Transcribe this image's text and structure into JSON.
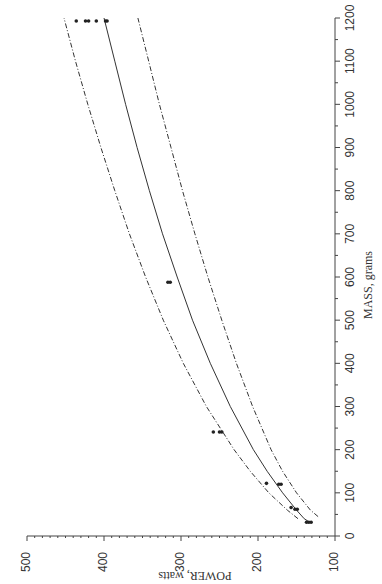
{
  "chart_data": {
    "type": "scatter",
    "title": "",
    "orientation": "rotated-90 (mass axis vertical on right, power axis horizontal at bottom, reversed)",
    "xlabel": "MASS, grams",
    "ylabel": "POWER, watts",
    "xlim": [
      0,
      1200
    ],
    "ylim": [
      100,
      500
    ],
    "x_ticks": [
      0,
      100,
      200,
      300,
      400,
      500,
      600,
      700,
      800,
      900,
      1000,
      1100,
      1200
    ],
    "y_ticks": [
      100,
      200,
      300,
      400,
      500
    ],
    "grid": false,
    "points": [
      {
        "mass": 32,
        "power": 131
      },
      {
        "mass": 32,
        "power": 134
      },
      {
        "mass": 32,
        "power": 137
      },
      {
        "mass": 62,
        "power": 149
      },
      {
        "mass": 62,
        "power": 152
      },
      {
        "mass": 66,
        "power": 157
      },
      {
        "mass": 120,
        "power": 170
      },
      {
        "mass": 120,
        "power": 173
      },
      {
        "mass": 122,
        "power": 189
      },
      {
        "mass": 241,
        "power": 247
      },
      {
        "mass": 241,
        "power": 250
      },
      {
        "mass": 241,
        "power": 258
      },
      {
        "mass": 588,
        "power": 314
      },
      {
        "mass": 588,
        "power": 317
      },
      {
        "mass": 1193,
        "power": 396
      },
      {
        "mass": 1193,
        "power": 398
      },
      {
        "mass": 1193,
        "power": 410
      },
      {
        "mass": 1193,
        "power": 420
      },
      {
        "mass": 1193,
        "power": 424
      },
      {
        "mass": 1193,
        "power": 436
      }
    ],
    "series": [
      {
        "name": "fit",
        "style": "solid",
        "mass": [
          32,
          40,
          60,
          100,
          150,
          200,
          300,
          400,
          500,
          600,
          700,
          800,
          900,
          1000,
          1100,
          1200
        ],
        "power": [
          133,
          140,
          150,
          168,
          188,
          206,
          236,
          262,
          285,
          305,
          324,
          341,
          357,
          372,
          386,
          400
        ]
      },
      {
        "name": "upper-bound",
        "style": "dash-dot",
        "mass": [
          40,
          60,
          100,
          150,
          200,
          300,
          400,
          500,
          600,
          700,
          800,
          900,
          1000,
          1100,
          1200
        ],
        "power": [
          148,
          162,
          186,
          210,
          231,
          267,
          297,
          323,
          346,
          367,
          386,
          404,
          421,
          437,
          452
        ]
      },
      {
        "name": "lower-bound",
        "style": "dash-dot",
        "mass": [
          45,
          60,
          100,
          150,
          200,
          300,
          400,
          500,
          600,
          700,
          800,
          900,
          1000,
          1100,
          1200
        ],
        "power": [
          122,
          132,
          150,
          168,
          183,
          207,
          228,
          247,
          265,
          282,
          298,
          313,
          328,
          342,
          356
        ]
      }
    ]
  },
  "labels": {
    "xlabel": "MASS, grams",
    "ylabel": "POWER, watts"
  }
}
